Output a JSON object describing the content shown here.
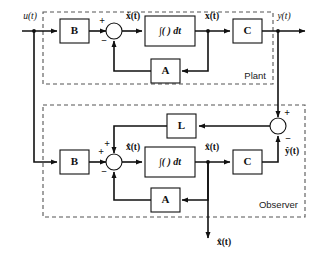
{
  "diagram": {
    "type": "control-system-block-diagram",
    "regions": [
      {
        "id": "plant",
        "label": "Plant"
      },
      {
        "id": "observer",
        "label": "Observer"
      }
    ],
    "blocks": {
      "plant_b": "B",
      "plant_integrator": "∫(  ) dt",
      "plant_c": "C",
      "plant_a": "A",
      "observer_b": "B",
      "observer_integrator": "∫(  ) dt",
      "observer_c": "C",
      "observer_a": "A",
      "observer_l": "L"
    },
    "signals": {
      "input": "u(t)",
      "plant_state_derivative": "ẋ(t)",
      "plant_state": "x(t)",
      "output": "y(t)",
      "observer_state_derivative": "x̂̇(t)",
      "observer_state": "x̂(t)",
      "observer_output": "ŷ(t)",
      "observer_state_out": "x̂(t)"
    },
    "signs": {
      "plant_sum_positive": "+",
      "plant_sum_negative": "−",
      "observer_sum_positive_top": "+",
      "observer_sum_positive_left": "+",
      "observer_sum_negative": "−",
      "error_sum_positive": "+",
      "error_sum_negative": "−"
    },
    "colors": {
      "background": "#ffffff",
      "wire": "#111111",
      "block_stroke": "#111111",
      "dashed_border": "#555555",
      "text": "#111111"
    }
  }
}
